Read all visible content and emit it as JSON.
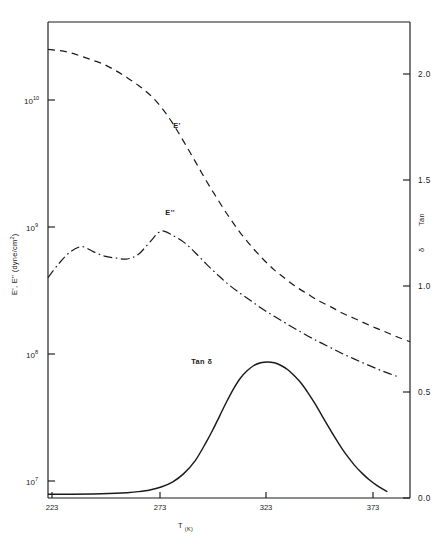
{
  "chart_data": {
    "type": "line",
    "title": "",
    "xlabel": "T (K)",
    "ylabel": "E', E'' (dyne/cm²)",
    "y2label": "Tan δ",
    "xlim": [
      223,
      383
    ],
    "xticks": [
      223,
      273,
      323,
      373
    ],
    "xticklabels": [
      "223",
      "273",
      "323",
      "373"
    ],
    "ylim": [
      10000000.0,
      31600000000.0
    ],
    "yscale": "log",
    "yticks": [
      10000000.0,
      100000000.0,
      1000000000.0,
      10000000000.0
    ],
    "yticklabels": [
      "10⁷",
      "10⁸",
      "10⁹",
      "10¹⁰"
    ],
    "y2lim": [
      0.0,
      2.25
    ],
    "y2ticks": [
      0.0,
      0.5,
      1.0,
      1.5,
      2.0
    ],
    "y2ticklabels": [
      "0.0",
      "0.5",
      "1.0",
      "1.5",
      "2.0"
    ],
    "grid": false,
    "legend": "inline-annotations",
    "series": [
      {
        "name": "E'",
        "axis": "left",
        "style": "dashed",
        "label_x": 280,
        "label_y": 6000000000.0,
        "x": [
          223,
          228,
          233,
          238,
          243,
          248,
          253,
          258,
          263,
          268,
          273,
          278,
          283,
          288,
          293,
          298,
          303,
          308,
          313,
          318,
          323,
          328,
          333,
          338,
          343,
          348,
          353,
          358,
          363,
          368,
          373,
          378,
          383
        ],
        "y": [
          25000000000.0,
          24500000000.0,
          23500000000.0,
          22000000000.0,
          20500000000.0,
          19000000000.0,
          17000000000.0,
          15000000000.0,
          13000000000.0,
          11000000000.0,
          8800000000.0,
          6600000000.0,
          4700000000.0,
          3300000000.0,
          2300000000.0,
          1650000000.0,
          1200000000.0,
          900000000.0,
          700000000.0,
          560000000.0,
          460000000.0,
          390000000.0,
          335000000.0,
          295000000.0,
          260000000.0,
          235000000.0,
          210000000.0,
          192000000.0,
          175000000.0,
          160000000.0,
          147000000.0,
          135000000.0,
          125000000.0
        ]
      },
      {
        "name": "E''",
        "axis": "left",
        "style": "dash-dot",
        "label_x": 277,
        "label_y": 1250000000.0,
        "x": [
          223,
          228,
          233,
          238,
          243,
          248,
          253,
          258,
          263,
          268,
          273,
          278,
          283,
          288,
          293,
          298,
          303,
          308,
          313,
          318,
          323,
          328,
          333,
          338,
          343,
          348,
          353,
          358,
          363,
          368,
          373,
          378
        ],
        "y": [
          400000000.0,
          520000000.0,
          640000000.0,
          700000000.0,
          640000000.0,
          590000000.0,
          570000000.0,
          560000000.0,
          610000000.0,
          760000000.0,
          930000000.0,
          860000000.0,
          760000000.0,
          630000000.0,
          510000000.0,
          420000000.0,
          350000000.0,
          300000000.0,
          260000000.0,
          225000000.0,
          198000000.0,
          175000000.0,
          155000000.0,
          138000000.0,
          124000000.0,
          112000000.0,
          101000000.0,
          92000000.0,
          84000000.0,
          77000000.0,
          71000000.0,
          66000000.0
        ]
      },
      {
        "name": "Tan δ",
        "axis": "right",
        "style": "solid",
        "label_x": 291,
        "label_y": 0.63,
        "x": [
          223,
          233,
          243,
          253,
          258,
          263,
          268,
          273,
          278,
          283,
          288,
          293,
          296,
          299,
          302,
          305,
          308,
          311,
          314,
          317,
          320,
          323,
          326,
          329,
          332,
          335,
          338,
          341,
          344,
          347,
          350,
          353,
          356,
          359,
          362,
          365,
          368,
          371,
          373
        ],
        "y": [
          0.018,
          0.018,
          0.019,
          0.022,
          0.025,
          0.03,
          0.038,
          0.052,
          0.075,
          0.115,
          0.175,
          0.265,
          0.325,
          0.39,
          0.455,
          0.515,
          0.565,
          0.6,
          0.625,
          0.638,
          0.642,
          0.638,
          0.625,
          0.605,
          0.575,
          0.54,
          0.495,
          0.445,
          0.39,
          0.335,
          0.282,
          0.232,
          0.188,
          0.148,
          0.115,
          0.086,
          0.062,
          0.042,
          0.03
        ]
      }
    ]
  },
  "axis": {
    "left_title_main": "E', E''",
    "left_title_units": "(dyne/cm",
    "left_title_units_sup": "2",
    "left_title_units_close": ")",
    "x_title_main": "T",
    "x_title_sub": "(K)",
    "right_title_line1": "Tan",
    "right_title_line2": "δ",
    "exp_base": "10"
  }
}
